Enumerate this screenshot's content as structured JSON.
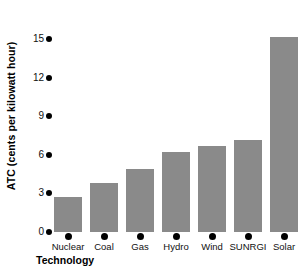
{
  "chart_data": {
    "type": "bar",
    "title": "",
    "xlabel": "Technology",
    "ylabel": "ATC (cents per kilowatt hour)",
    "categories": [
      "Nuclear",
      "Coal",
      "Gas",
      "Hydro",
      "Wind",
      "SUNRGI",
      "Solar"
    ],
    "values": [
      2.7,
      3.8,
      4.9,
      6.2,
      6.7,
      7.2,
      15.2
    ],
    "yticks": [
      0,
      3,
      6,
      9,
      12,
      15
    ],
    "ylim": [
      0,
      16.5
    ],
    "grid": false,
    "legend": false,
    "bar_color": "#8a8a8a",
    "axis_marker_color": "#000000"
  }
}
